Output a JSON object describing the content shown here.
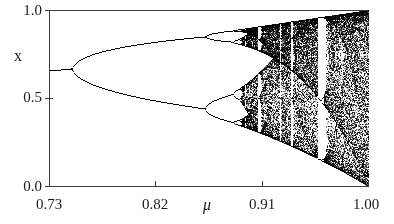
{
  "chart_data": {
    "type": "scatter",
    "title": "",
    "subtitle": "",
    "xlabel": "μ",
    "ylabel": "x",
    "xlim": [
      0.73,
      1.0
    ],
    "ylim": [
      0.0,
      1.0
    ],
    "grid": false,
    "legend": null,
    "x_ticks": [
      0.73,
      0.82,
      0.91,
      1.0
    ],
    "x_tick_labels": [
      "0.73",
      "0.82",
      "0.91",
      "1.00"
    ],
    "y_ticks": [
      0.0,
      0.5,
      1.0
    ],
    "y_tick_labels": [
      "0.0",
      "0.5",
      "1.00"
    ],
    "map": {
      "equation": "x_{n+1} = 4*mu*x_n*(1-x_n)",
      "r_factor": 4,
      "transient_iterations": 300,
      "plotted_iterations": 260,
      "x0": 0.35
    },
    "features": {
      "fixed_point_value_at_xmin": 0.657,
      "bifurcation_points_mu": [
        0.75,
        0.8623,
        0.886,
        0.8911,
        0.8922
      ],
      "onset_of_chaos_mu": 0.8925,
      "periodic_windows_mu": [
        {
          "center": 0.9135,
          "width": 0.0045,
          "period": 5
        },
        {
          "center": 0.9375,
          "width": 0.003,
          "period": 6
        },
        {
          "center": 0.958,
          "width": 0.0085,
          "period": 3
        },
        {
          "center": 0.9725,
          "width": 0.003,
          "period": 5
        },
        {
          "center": 0.9905,
          "width": 0.0022,
          "period": 4
        }
      ],
      "upper_envelope_at_xmax": 1.0,
      "lower_envelope_at_xmax": 0.0
    },
    "series": [
      {
        "name": "attractor",
        "color": "#000000",
        "point_size_px": 1
      }
    ]
  },
  "axes": {
    "y_label": "x",
    "x_label": "μ",
    "y_tick_labels": [
      "1.0",
      "0.5",
      "0.0"
    ],
    "x_tick_labels": [
      "0.73",
      "0.82",
      "0.91",
      "1.00"
    ]
  },
  "style": {
    "axis_color": "#3a3a3a",
    "data_color": "#000000",
    "background": "#ffffff",
    "text_color": "#1a1a1a"
  },
  "geometry": {
    "plot_left_px": 49,
    "plot_right_px": 368,
    "plot_top_px": 10,
    "plot_bottom_px": 186
  }
}
